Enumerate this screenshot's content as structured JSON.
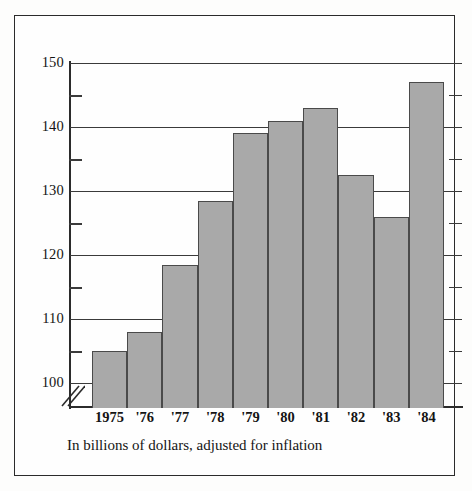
{
  "chart_data": {
    "type": "bar",
    "title": "",
    "subtitle": "",
    "caption": "In billions of dollars, adjusted for inflation",
    "xlabel": "",
    "ylabel": "",
    "categories": [
      "1975",
      "'76",
      "'77",
      "'78",
      "'79",
      "'80",
      "'81",
      "'82",
      "'83",
      "'84"
    ],
    "values": [
      105,
      108,
      118.5,
      128.5,
      139,
      141,
      143,
      132.5,
      126,
      147
    ],
    "ylim": [
      95,
      150
    ],
    "y_axis_break": true,
    "y_axis_break_below": 100,
    "major_ticks": [
      100,
      110,
      120,
      130,
      140,
      150
    ],
    "major_tick_labels": [
      "100",
      "110",
      "120",
      "130",
      "140",
      "150"
    ],
    "minor_ticks": [
      105,
      115,
      125,
      135,
      145
    ],
    "grid": "horizontal-major",
    "legend": "none",
    "bar_fill_color": "#a9a9a9",
    "bar_edge_color": "#4a4a4a",
    "axis_color": "#2b2b2b",
    "background_color": "#fefefe"
  },
  "figure": {
    "caption": "In billions of dollars, adjusted for inflation"
  }
}
